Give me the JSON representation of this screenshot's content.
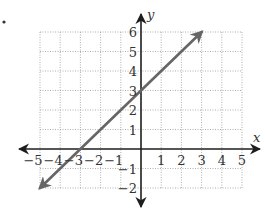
{
  "chart_data": {
    "type": "line",
    "title": "",
    "xlabel": "x",
    "ylabel": "y",
    "xlim": [
      -5,
      5
    ],
    "ylim": [
      -2,
      6
    ],
    "grid": true,
    "x_ticks": [
      -5,
      -4,
      -3,
      -2,
      -1,
      1,
      2,
      3,
      4,
      5
    ],
    "x_tick_labels": [
      "−5",
      "−4",
      "−3",
      "−2",
      "−1",
      "1",
      "2",
      "3",
      "4",
      "5"
    ],
    "y_ticks": [
      -2,
      -1,
      1,
      2,
      3,
      4,
      5,
      6
    ],
    "y_tick_labels": [
      "−2",
      "−1",
      "1",
      "2",
      "3",
      "4",
      "5",
      "6"
    ],
    "series": [
      {
        "name": "y = x + 3",
        "equation": "y = x + 3",
        "slope": 1,
        "intercept": 3,
        "points": [
          [
            -5,
            -2
          ],
          [
            -3,
            0
          ],
          [
            0,
            3
          ],
          [
            3,
            6
          ]
        ],
        "arrows": "both",
        "color": "#666666"
      }
    ],
    "legend": null
  },
  "marker": {
    "bullet": "•"
  },
  "colors": {
    "axis": "#1e1e1e",
    "grid": "#9a9a9a",
    "line": "#666666",
    "text": "#333333"
  }
}
